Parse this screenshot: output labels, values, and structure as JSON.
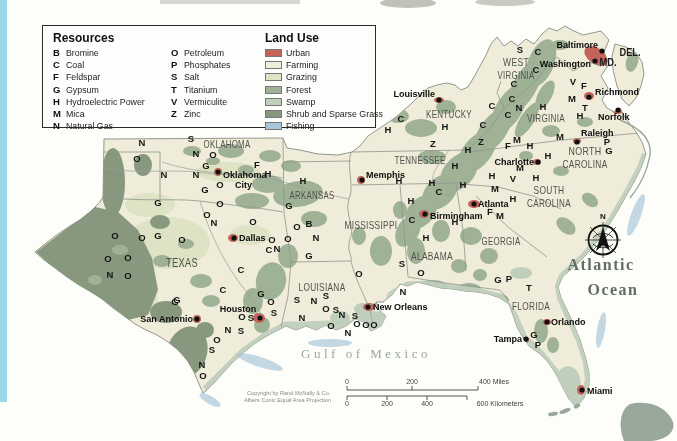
{
  "page": {
    "background": "#fdfdfa",
    "left_strip_color": "#9bd8e8"
  },
  "legend": {
    "resources_title": "Resources",
    "resources": [
      {
        "code": "B",
        "name": "Bromine"
      },
      {
        "code": "C",
        "name": "Coal"
      },
      {
        "code": "F",
        "name": "Feldspar"
      },
      {
        "code": "G",
        "name": "Gypsum"
      },
      {
        "code": "H",
        "name": "Hydroelectric Power"
      },
      {
        "code": "M",
        "name": "Mica"
      },
      {
        "code": "N",
        "name": "Natural Gas"
      },
      {
        "code": "O",
        "name": "Petroleum"
      },
      {
        "code": "P",
        "name": "Phosphates"
      },
      {
        "code": "S",
        "name": "Salt"
      },
      {
        "code": "T",
        "name": "Titanium"
      },
      {
        "code": "V",
        "name": "Vermiculite"
      },
      {
        "code": "Z",
        "name": "Zinc"
      }
    ],
    "land_use_title": "Land Use",
    "land_use": [
      {
        "key": "urban",
        "label": "Urban",
        "color": "#c4635a"
      },
      {
        "key": "farming",
        "label": "Farming",
        "color": "#efecd9"
      },
      {
        "key": "grazing",
        "label": "Grazing",
        "color": "#dde3c4"
      },
      {
        "key": "forest",
        "label": "Forest",
        "color": "#9fb296"
      },
      {
        "key": "swamp",
        "label": "Swamp",
        "color": "#bfcfbc"
      },
      {
        "key": "shrub",
        "label": "Shrub and Sparse Grass",
        "color": "#87987e"
      },
      {
        "key": "fishing",
        "label": "Fishing",
        "color": "#a9c7d9"
      }
    ]
  },
  "map": {
    "states": [
      {
        "lines": [
          {
            "t": "OKLAHOMA",
            "w": 47
          }
        ],
        "x": 227,
        "y": 148,
        "s": 11
      },
      {
        "lines": [
          {
            "t": "TEXAS",
            "w": 32
          }
        ],
        "x": 182,
        "y": 267,
        "s": 12
      },
      {
        "lines": [
          {
            "t": "ARKANSAS",
            "w": 45
          }
        ],
        "x": 312,
        "y": 199,
        "s": 10.5
      },
      {
        "lines": [
          {
            "t": "LOUISIANA",
            "w": 47
          }
        ],
        "x": 322,
        "y": 291,
        "s": 10.5
      },
      {
        "lines": [
          {
            "t": "MISSISSIPPI",
            "w": 53
          }
        ],
        "x": 371,
        "y": 229,
        "s": 10.5
      },
      {
        "lines": [
          {
            "t": "ALABAMA",
            "w": 42
          }
        ],
        "x": 432,
        "y": 260,
        "s": 10.5
      },
      {
        "lines": [
          {
            "t": "GEORGIA",
            "w": 39
          }
        ],
        "x": 501,
        "y": 245,
        "s": 10.5
      },
      {
        "lines": [
          {
            "t": "FLORIDA",
            "w": 38
          }
        ],
        "x": 531,
        "y": 310,
        "s": 10.5
      },
      {
        "lines": [
          {
            "t": "TENNESSEE",
            "w": 51
          }
        ],
        "x": 420,
        "y": 164,
        "s": 10.5
      },
      {
        "lines": [
          {
            "t": "KENTUCKY",
            "w": 46
          }
        ],
        "x": 449,
        "y": 118,
        "s": 10.5
      },
      {
        "lines": [
          {
            "t": "WEST",
            "w": 26
          },
          {
            "t": "VIRGINIA",
            "w": 37
          }
        ],
        "x": 516,
        "y": 66,
        "s": 10,
        "lh": 13
      },
      {
        "lines": [
          {
            "t": "VIRGINIA",
            "w": 38
          }
        ],
        "x": 546,
        "y": 122,
        "s": 10.5
      },
      {
        "lines": [
          {
            "t": "NORTH",
            "w": 33
          },
          {
            "t": "CAROLINA",
            "w": 45
          }
        ],
        "x": 585,
        "y": 155,
        "s": 10.5,
        "lh": 13
      },
      {
        "lines": [
          {
            "t": "SOUTH",
            "w": 31
          },
          {
            "t": "CAROLINA",
            "w": 44
          }
        ],
        "x": 549,
        "y": 194,
        "s": 10.5,
        "lh": 13
      },
      {
        "lines": [
          {
            "t": "MD.",
            "w": 17
          }
        ],
        "x": 608,
        "y": 66,
        "s": 10.5,
        "abbr": true
      },
      {
        "lines": [
          {
            "t": "DEL.",
            "w": 21
          }
        ],
        "x": 630,
        "y": 56,
        "s": 10.5,
        "abbr": true
      }
    ],
    "cities": [
      {
        "name": "Baltimore",
        "dot": [
          602,
          51
        ],
        "lx": 598,
        "ly": 48,
        "anchor": "end"
      },
      {
        "name": "Washington",
        "dot": [
          595,
          61
        ],
        "lx": 591,
        "ly": 67,
        "anchor": "end"
      },
      {
        "name": "Richmond",
        "dot": [
          589,
          97
        ],
        "lx": 595,
        "ly": 95,
        "anchor": "start"
      },
      {
        "name": "Norfolk",
        "dot": [
          618,
          110
        ],
        "lx": 598,
        "ly": 120,
        "anchor": "start"
      },
      {
        "name": "Raleigh",
        "dot": [
          577,
          142
        ],
        "lx": 581,
        "ly": 136,
        "anchor": "start"
      },
      {
        "name": "Charlotte",
        "dot": [
          538,
          162
        ],
        "lx": 534,
        "ly": 165,
        "anchor": "end"
      },
      {
        "name": "Louisville",
        "dot": [
          439,
          100
        ],
        "lx": 435,
        "ly": 97,
        "anchor": "end"
      },
      {
        "name": "Memphis",
        "dot": [
          362,
          180
        ],
        "lx": 366,
        "ly": 178,
        "anchor": "start"
      },
      {
        "name": "Birmingham",
        "dot": [
          425,
          214
        ],
        "lx": 430,
        "ly": 219,
        "anchor": "start"
      },
      {
        "name": "Atlanta",
        "dot": [
          474,
          204
        ],
        "lx": 478,
        "ly": 207,
        "anchor": "start"
      },
      {
        "name": "Oklahoma City",
        "lines": [
          "Oklahoma",
          "City"
        ],
        "dot": [
          218,
          172
        ],
        "lx": 223,
        "ly": 178,
        "anchor": "start",
        "lh": 10,
        "dx2": 12
      },
      {
        "name": "Dallas",
        "dot": [
          234,
          238
        ],
        "lx": 239,
        "ly": 241,
        "anchor": "start"
      },
      {
        "name": "San Antonio",
        "dot": [
          197,
          319
        ],
        "lx": 193,
        "ly": 322,
        "anchor": "end"
      },
      {
        "name": "Houston",
        "dot": [
          260,
          318
        ],
        "lx": 238,
        "ly": 312,
        "anchor": "middle"
      },
      {
        "name": "New Orleans",
        "dot": [
          368,
          307
        ],
        "lx": 373,
        "ly": 310,
        "anchor": "start"
      },
      {
        "name": "Orlando",
        "dot": [
          547,
          322
        ],
        "lx": 551,
        "ly": 325,
        "anchor": "start"
      },
      {
        "name": "Tampa",
        "dot": [
          526,
          339
        ],
        "lx": 522,
        "ly": 342,
        "anchor": "end"
      },
      {
        "name": "Miami",
        "dot": [
          582,
          390
        ],
        "lx": 587,
        "ly": 394,
        "anchor": "start"
      }
    ],
    "letters": [
      {
        "t": "N",
        "x": 142,
        "y": 146
      },
      {
        "t": "O",
        "x": 137,
        "y": 162
      },
      {
        "t": "S",
        "x": 191,
        "y": 142
      },
      {
        "t": "N",
        "x": 196,
        "y": 157
      },
      {
        "t": "O",
        "x": 213,
        "y": 158
      },
      {
        "t": "G",
        "x": 206,
        "y": 169
      },
      {
        "t": "N",
        "x": 164,
        "y": 178
      },
      {
        "t": "N",
        "x": 196,
        "y": 178
      },
      {
        "t": "F",
        "x": 257,
        "y": 168
      },
      {
        "t": "H",
        "x": 268,
        "y": 177
      },
      {
        "t": "O",
        "x": 220,
        "y": 188
      },
      {
        "t": "G",
        "x": 205,
        "y": 193
      },
      {
        "t": "G",
        "x": 158,
        "y": 206
      },
      {
        "t": "O",
        "x": 220,
        "y": 207
      },
      {
        "t": "O",
        "x": 207,
        "y": 218
      },
      {
        "t": "N",
        "x": 214,
        "y": 226
      },
      {
        "t": "O",
        "x": 253,
        "y": 225
      },
      {
        "t": "O",
        "x": 115,
        "y": 239
      },
      {
        "t": "O",
        "x": 142,
        "y": 241
      },
      {
        "t": "G",
        "x": 158,
        "y": 239
      },
      {
        "t": "O",
        "x": 182,
        "y": 243
      },
      {
        "t": "O",
        "x": 108,
        "y": 262
      },
      {
        "t": "O",
        "x": 128,
        "y": 261
      },
      {
        "t": "N",
        "x": 110,
        "y": 278
      },
      {
        "t": "O",
        "x": 128,
        "y": 279
      },
      {
        "t": "G",
        "x": 177,
        "y": 303
      },
      {
        "t": "O",
        "x": 272,
        "y": 243
      },
      {
        "t": "O",
        "x": 288,
        "y": 242
      },
      {
        "t": "C",
        "x": 269,
        "y": 253
      },
      {
        "t": "N",
        "x": 277,
        "y": 252
      },
      {
        "t": "C",
        "x": 241,
        "y": 273
      },
      {
        "t": "C",
        "x": 223,
        "y": 293
      },
      {
        "t": "G",
        "x": 175,
        "y": 305
      },
      {
        "t": "O",
        "x": 242,
        "y": 320
      },
      {
        "t": "S",
        "x": 251,
        "y": 321
      },
      {
        "t": "O",
        "x": 271,
        "y": 305
      },
      {
        "t": "S",
        "x": 274,
        "y": 316
      },
      {
        "t": "N",
        "x": 228,
        "y": 333
      },
      {
        "t": "S",
        "x": 241,
        "y": 334
      },
      {
        "t": "O",
        "x": 217,
        "y": 343
      },
      {
        "t": "S",
        "x": 212,
        "y": 353
      },
      {
        "t": "N",
        "x": 202,
        "y": 368
      },
      {
        "t": "O",
        "x": 203,
        "y": 379
      },
      {
        "t": "G",
        "x": 261,
        "y": 297
      },
      {
        "t": "S",
        "x": 297,
        "y": 303
      },
      {
        "t": "N",
        "x": 314,
        "y": 304
      },
      {
        "t": "S",
        "x": 326,
        "y": 299
      },
      {
        "t": "O",
        "x": 326,
        "y": 312
      },
      {
        "t": "S",
        "x": 336,
        "y": 313
      },
      {
        "t": "N",
        "x": 302,
        "y": 321
      },
      {
        "t": "N",
        "x": 342,
        "y": 318
      },
      {
        "t": "S",
        "x": 355,
        "y": 319
      },
      {
        "t": "O",
        "x": 331,
        "y": 329
      },
      {
        "t": "N",
        "x": 348,
        "y": 336
      },
      {
        "t": "O",
        "x": 357,
        "y": 327
      },
      {
        "t": "O",
        "x": 366,
        "y": 328
      },
      {
        "t": "O",
        "x": 374,
        "y": 328
      },
      {
        "t": "N",
        "x": 403,
        "y": 295
      },
      {
        "t": "H",
        "x": 303,
        "y": 184
      },
      {
        "t": "G",
        "x": 289,
        "y": 209
      },
      {
        "t": "O",
        "x": 297,
        "y": 230
      },
      {
        "t": "B",
        "x": 309,
        "y": 227
      },
      {
        "t": "N",
        "x": 316,
        "y": 241
      },
      {
        "t": "G",
        "x": 309,
        "y": 259
      },
      {
        "t": "O",
        "x": 359,
        "y": 277
      },
      {
        "t": "H",
        "x": 399,
        "y": 184
      },
      {
        "t": "S",
        "x": 402,
        "y": 267
      },
      {
        "t": "O",
        "x": 421,
        "y": 276
      },
      {
        "t": "H",
        "x": 411,
        "y": 204
      },
      {
        "t": "C",
        "x": 412,
        "y": 223
      },
      {
        "t": "H",
        "x": 426,
        "y": 241
      },
      {
        "t": "H",
        "x": 455,
        "y": 225
      },
      {
        "t": "C",
        "x": 439,
        "y": 195
      },
      {
        "t": "H",
        "x": 432,
        "y": 186
      },
      {
        "t": "H",
        "x": 463,
        "y": 188
      },
      {
        "t": "C",
        "x": 401,
        "y": 122
      },
      {
        "t": "H",
        "x": 388,
        "y": 133
      },
      {
        "t": "H",
        "x": 445,
        "y": 130
      },
      {
        "t": "C",
        "x": 483,
        "y": 128
      },
      {
        "t": "C",
        "x": 492,
        "y": 109
      },
      {
        "t": "C",
        "x": 508,
        "y": 118
      },
      {
        "t": "N",
        "x": 519,
        "y": 111
      },
      {
        "t": "H",
        "x": 543,
        "y": 110
      },
      {
        "t": "Z",
        "x": 433,
        "y": 147
      },
      {
        "t": "Z",
        "x": 481,
        "y": 145
      },
      {
        "t": "H",
        "x": 468,
        "y": 153
      },
      {
        "t": "H",
        "x": 455,
        "y": 169
      },
      {
        "t": "S",
        "x": 520,
        "y": 53
      },
      {
        "t": "C",
        "x": 538,
        "y": 55
      },
      {
        "t": "C",
        "x": 536,
        "y": 73
      },
      {
        "t": "C",
        "x": 514,
        "y": 87
      },
      {
        "t": "C",
        "x": 512,
        "y": 102
      },
      {
        "t": "V",
        "x": 573,
        "y": 85
      },
      {
        "t": "F",
        "x": 584,
        "y": 89
      },
      {
        "t": "M",
        "x": 572,
        "y": 102
      },
      {
        "t": "T",
        "x": 585,
        "y": 111
      },
      {
        "t": "H",
        "x": 580,
        "y": 119
      },
      {
        "t": "M",
        "x": 560,
        "y": 140
      },
      {
        "t": "P",
        "x": 607,
        "y": 145
      },
      {
        "t": "G",
        "x": 609,
        "y": 154
      },
      {
        "t": "M",
        "x": 517,
        "y": 143
      },
      {
        "t": "F",
        "x": 508,
        "y": 149
      },
      {
        "t": "H",
        "x": 530,
        "y": 149
      },
      {
        "t": "H",
        "x": 548,
        "y": 159
      },
      {
        "t": "M",
        "x": 520,
        "y": 171
      },
      {
        "t": "H",
        "x": 492,
        "y": 179
      },
      {
        "t": "V",
        "x": 513,
        "y": 182
      },
      {
        "t": "H",
        "x": 536,
        "y": 181
      },
      {
        "t": "M",
        "x": 495,
        "y": 192
      },
      {
        "t": "H",
        "x": 513,
        "y": 202
      },
      {
        "t": "F",
        "x": 490,
        "y": 215
      },
      {
        "t": "M",
        "x": 500,
        "y": 219
      },
      {
        "t": "G",
        "x": 498,
        "y": 283
      },
      {
        "t": "P",
        "x": 509,
        "y": 282
      },
      {
        "t": "T",
        "x": 529,
        "y": 291
      },
      {
        "t": "G",
        "x": 534,
        "y": 338
      },
      {
        "t": "P",
        "x": 538,
        "y": 348
      }
    ],
    "water_labels": [
      {
        "text": "Gulf of Mexico",
        "x": 366,
        "y": 358,
        "cls": "gulf-label"
      },
      {
        "text": "Atlantic",
        "x": 601,
        "y": 270,
        "cls": "ocean-label"
      },
      {
        "text": "Ocean",
        "x": 613,
        "y": 295,
        "cls": "ocean-label"
      }
    ],
    "compass": {
      "label": "N"
    },
    "scale": {
      "miles_ticks": [
        {
          "t": "0",
          "x": 347
        },
        {
          "t": "200",
          "x": 412
        },
        {
          "t": "400 Miles",
          "x": 494
        }
      ],
      "km_ticks": [
        {
          "t": "0",
          "x": 347
        },
        {
          "t": "200",
          "x": 387
        },
        {
          "t": "400",
          "x": 427
        },
        {
          "t": "600 Kilometers",
          "x": 500
        }
      ]
    },
    "credits": [
      {
        "t": "Copyright by Rand McNally & Co.",
        "x": 247,
        "y": 395
      },
      {
        "t": "Albers Conic Equal Area Projection",
        "x": 244,
        "y": 402
      }
    ]
  }
}
